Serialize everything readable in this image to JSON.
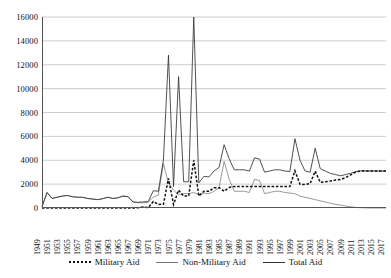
{
  "chart_data": {
    "type": "line",
    "title": "",
    "xlabel": "",
    "ylabel": "",
    "ylim": [
      0,
      16000
    ],
    "xlim": [
      1949,
      2017
    ],
    "grid": true,
    "legend_position": "bottom",
    "ytick_labels": [
      "16000",
      "14000",
      "12000",
      "10000",
      "8000",
      "6000",
      "4000",
      "2000",
      "0"
    ],
    "ytick_values": [
      16000,
      14000,
      12000,
      10000,
      8000,
      6000,
      4000,
      2000,
      0
    ],
    "xtick_labels": [
      "1949",
      "1951",
      "1953",
      "1955",
      "1957",
      "1959",
      "1961",
      "1963",
      "1965",
      "1967",
      "1969",
      "1971",
      "1973",
      "1975",
      "1977",
      "1979",
      "1981",
      "1983",
      "1985",
      "1987",
      "1989",
      "1991",
      "1993",
      "1995",
      "1997",
      "1999",
      "2001",
      "2003",
      "2005",
      "2007",
      "2009",
      "2011",
      "2013",
      "2015",
      "2017"
    ],
    "x": [
      1949,
      1950,
      1951,
      1952,
      1953,
      1954,
      1955,
      1956,
      1957,
      1958,
      1959,
      1960,
      1961,
      1962,
      1963,
      1964,
      1965,
      1966,
      1967,
      1968,
      1969,
      1970,
      1971,
      1972,
      1973,
      1974,
      1975,
      1976,
      1977,
      1978,
      1979,
      1980,
      1981,
      1982,
      1983,
      1984,
      1985,
      1986,
      1987,
      1988,
      1989,
      1990,
      1991,
      1992,
      1993,
      1994,
      1995,
      1996,
      1997,
      1998,
      1999,
      2000,
      2001,
      2002,
      2003,
      2004,
      2005,
      2006,
      2007,
      2008,
      2009,
      2010,
      2011,
      2012,
      2013,
      2014,
      2015,
      2016,
      2017
    ],
    "series": [
      {
        "name": "Military Aid",
        "style": "dashed",
        "color": "#111111",
        "values": [
          0,
          0,
          0,
          0,
          0,
          0,
          0,
          0,
          0,
          0,
          0,
          0,
          0,
          0,
          0,
          0,
          0,
          0,
          0,
          25,
          85,
          30,
          545,
          300,
          307,
          2482,
          300,
          1500,
          1000,
          1000,
          4000,
          1000,
          1400,
          1400,
          1700,
          1700,
          1400,
          1723,
          1800,
          1800,
          1800,
          1792,
          1800,
          1800,
          1800,
          1800,
          1800,
          1800,
          1800,
          1800,
          3120,
          1980,
          1976,
          2040,
          3086,
          2147,
          2202,
          2257,
          2340,
          2380,
          2550,
          2775,
          3000,
          3100,
          3100,
          3100,
          3100,
          3100,
          3100
        ]
      },
      {
        "name": "Non-Military Aid",
        "style": "thin-solid",
        "color": "#777777",
        "values": [
          100,
          1300,
          800,
          900,
          1000,
          1050,
          950,
          900,
          900,
          800,
          750,
          700,
          780,
          900,
          800,
          850,
          1000,
          950,
          500,
          450,
          430,
          500,
          900,
          1100,
          3700,
          2100,
          1500,
          1100,
          1200,
          1200,
          1300,
          1100,
          1250,
          1200,
          1400,
          1700,
          3900,
          2400,
          1400,
          1400,
          1400,
          1300,
          2400,
          2300,
          1200,
          1300,
          1400,
          1400,
          1300,
          1250,
          1200,
          1000,
          900,
          800,
          700,
          600,
          500,
          400,
          300,
          250,
          170,
          100,
          50,
          20,
          10,
          0,
          0,
          0,
          0
        ]
      },
      {
        "name": "Total Aid",
        "style": "solid",
        "color": "#333333",
        "values": [
          100,
          1300,
          800,
          900,
          1000,
          1050,
          950,
          900,
          900,
          800,
          750,
          700,
          780,
          900,
          800,
          850,
          1000,
          950,
          500,
          475,
          515,
          530,
          1445,
          1400,
          4007,
          12800,
          1800,
          11000,
          2200,
          2200,
          16000,
          2100,
          2650,
          2600,
          3100,
          3400,
          5300,
          4123,
          3200,
          3200,
          3200,
          3092,
          4200,
          4100,
          3000,
          3100,
          3200,
          3200,
          3100,
          3050,
          5800,
          4000,
          3100,
          3000,
          5000,
          3300,
          3100,
          2900,
          2800,
          2700,
          2800,
          2900,
          3050,
          3120,
          3110,
          3100,
          3100,
          3100,
          3100
        ]
      }
    ]
  },
  "legend": {
    "items": [
      {
        "label": "Military Aid"
      },
      {
        "label": "Non-Military Aid"
      },
      {
        "label": "Total Aid"
      }
    ]
  }
}
